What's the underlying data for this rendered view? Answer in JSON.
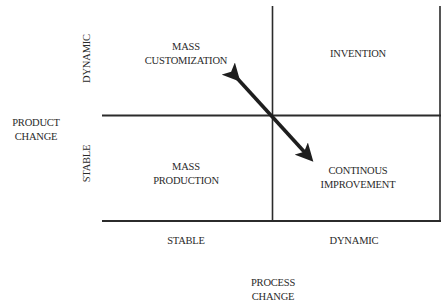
{
  "diagram": {
    "type": "2x2 matrix",
    "y_axis": {
      "title_line1": "PRODUCT",
      "title_line2": "CHANGE",
      "top_label": "DYNAMIC",
      "bottom_label": "STABLE"
    },
    "x_axis": {
      "title_line1": "PROCESS",
      "title_line2": "CHANGE",
      "left_label": "STABLE",
      "right_label": "DYNAMIC"
    },
    "quadrants": {
      "top_left": {
        "line1": "MASS",
        "line2": "CUSTOMIZATION"
      },
      "top_right": {
        "line1": "INVENTION"
      },
      "bottom_left": {
        "line1": "MASS",
        "line2": "PRODUCTION"
      },
      "bottom_right": {
        "line1": "CONTINOUS",
        "line2": "IMPROVEMENT"
      }
    },
    "arrow": {
      "type": "double-headed",
      "from": "MASS CUSTOMIZATION",
      "to": "CONTINOUS IMPROVEMENT"
    },
    "colors": {
      "line": "#2b2b2b",
      "arrow": "#1e1e1e",
      "text": "#2a2a2a"
    }
  }
}
